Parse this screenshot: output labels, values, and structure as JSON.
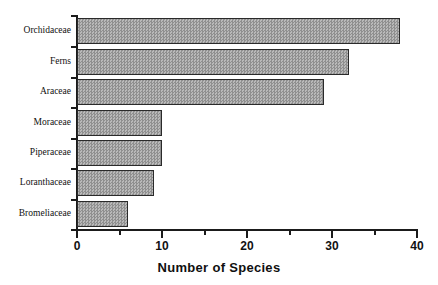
{
  "chart_data": {
    "type": "bar",
    "orientation": "horizontal",
    "title": "",
    "xlabel": "Number of Species",
    "ylabel": "",
    "categories": [
      "Orchidaceae",
      "Ferns",
      "Araceae",
      "Moraceae",
      "Piperaceae",
      "Loranthaceae",
      "Bromeliaceae"
    ],
    "values": [
      38,
      32,
      29,
      10,
      10,
      9,
      6
    ],
    "xlim": [
      0,
      40
    ],
    "xticks": [
      0,
      10,
      20,
      30,
      40
    ],
    "xtick_labels": [
      "0",
      "10",
      "20",
      "30",
      "40"
    ],
    "minor_xticks": [
      5,
      15,
      25,
      35
    ],
    "grid": false,
    "legend": null,
    "bar_fill_color": "#a3a3a3",
    "bar_edge_color": "#2a2a2a",
    "axis_color": "#1b1b1b",
    "background_color": "#ffffff"
  }
}
